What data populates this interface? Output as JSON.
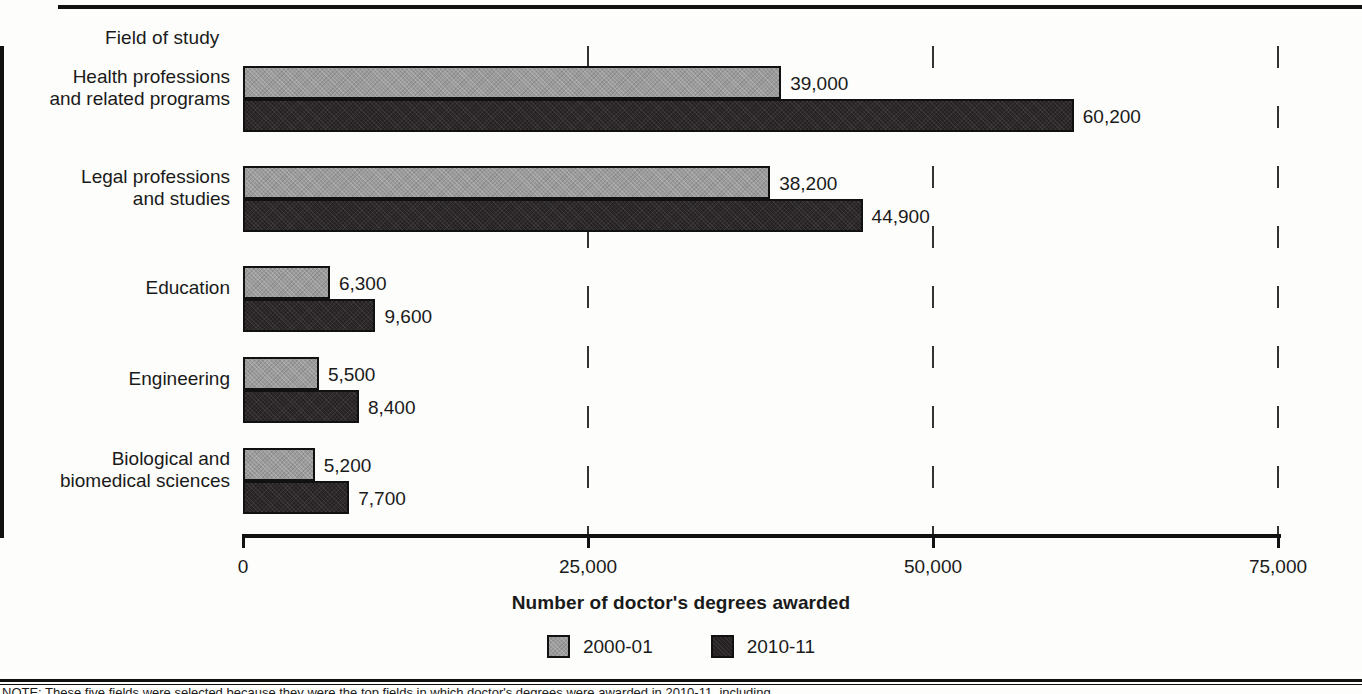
{
  "chart_data": {
    "type": "bar",
    "orientation": "horizontal",
    "title": "",
    "axis_title": "Field of study",
    "xlabel": "Number of doctor's degrees awarded",
    "ylabel": "Field of study",
    "xlim": [
      0,
      75000
    ],
    "xticks": [
      0,
      25000,
      50000,
      75000
    ],
    "xticklabels": [
      "0",
      "25,000",
      "50,000",
      "75,000"
    ],
    "grid": "vertical-dashed",
    "legend_position": "bottom-center",
    "categories": [
      "Health professions\nand related programs",
      "Legal professions\nand studies",
      "Education",
      "Engineering",
      "Biological and\nbiomedical sciences"
    ],
    "series": [
      {
        "name": "2000-01",
        "color": "#9b9b9b",
        "values": [
          39000,
          38200,
          6300,
          5500,
          5200
        ],
        "labels": [
          "39,000",
          "38,200",
          "6,300",
          "5,500",
          "5,200"
        ]
      },
      {
        "name": "2010-11",
        "color": "#262223",
        "values": [
          60200,
          44900,
          9600,
          8400,
          7700
        ],
        "labels": [
          "60,200",
          "44,900",
          "9,600",
          "8,400",
          "7,700"
        ]
      }
    ]
  },
  "legend": {
    "items": [
      {
        "label": "2000-01",
        "color": "#9b9b9b"
      },
      {
        "label": "2010-11",
        "color": "#262223"
      }
    ]
  },
  "footer": {
    "note": "NOTE: These five fields were selected because they were the top fields in which doctor's degrees were awarded in 2010-11, including"
  }
}
